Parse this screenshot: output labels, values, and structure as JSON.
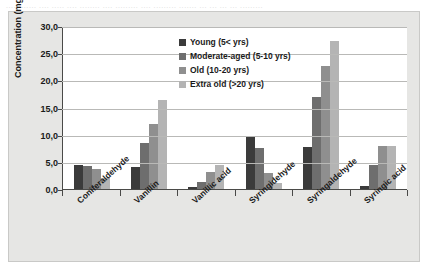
{
  "scan_header": "............ .... ..... .... ........ .... ......... .... ......... ....... ... ... ... ... .........",
  "chart_data": {
    "type": "bar",
    "title": "",
    "xlabel": "",
    "ylabel": "Concentration (mg/L)",
    "ylim": [
      0,
      30
    ],
    "ytick_labels": [
      "0,0",
      "5,0",
      "10,0",
      "15,0",
      "20,0",
      "25,0",
      "30,0"
    ],
    "ytick_values": [
      0,
      5,
      10,
      15,
      20,
      25,
      30
    ],
    "grid": true,
    "legend_position": "top-center-right",
    "categories": [
      "Coniferaldehyde",
      "Vanillin",
      "Vanillic acid",
      "Syringidehyde",
      "Syringaldehyde",
      "Syringic acid"
    ],
    "series": [
      {
        "name": "Young (5< yrs)",
        "color": "#3b3b3b",
        "values": [
          4.4,
          4.0,
          0.3,
          9.7,
          7.7,
          0.6
        ]
      },
      {
        "name": "Moderate-aged (5-10 yrs)",
        "color": "#6e6e6e",
        "values": [
          4.3,
          8.5,
          1.3,
          7.5,
          16.9,
          4.5
        ]
      },
      {
        "name": "Old (10-20 yrs)",
        "color": "#8f8f8f",
        "values": [
          3.7,
          12.0,
          3.2,
          3.0,
          22.6,
          7.9
        ]
      },
      {
        "name": "Extra old (>20 yrs)",
        "color": "#b4b4b4",
        "values": [
          2.1,
          16.4,
          4.4,
          1.1,
          27.3,
          7.9
        ]
      }
    ]
  },
  "colors": {
    "card_background": "#e6e6e4",
    "plot_background": "#ffffff",
    "axis": "#4a4a48",
    "gridline": "#b9b9b7",
    "text": "#1a1a1a"
  }
}
